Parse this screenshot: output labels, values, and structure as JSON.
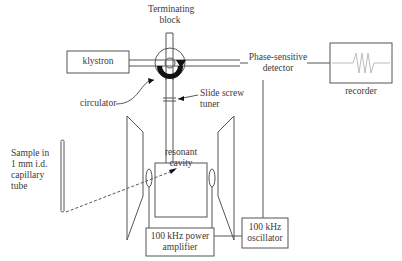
{
  "diagram": {
    "components": {
      "terminating_block": {
        "line1": "Terminating",
        "line2": "block"
      },
      "klystron": "klystron",
      "phase_detector": {
        "line1": "Phase-sensitive",
        "line2": "detector"
      },
      "recorder": "recorder",
      "circulator": "circulator",
      "slide_screw": {
        "line1": "Slide screw",
        "line2": "tuner"
      },
      "sample": {
        "line1": "Sample in",
        "line2": "1 mm i.d.",
        "line3": "capillary",
        "line4": "tube"
      },
      "cavity": {
        "line1": "resonant",
        "line2": "cavity"
      },
      "amplifier": {
        "line1": "100 kHz power",
        "line2": "amplifier"
      },
      "oscillator": {
        "line1": "100 kHz",
        "line2": "oscillator"
      }
    },
    "colors": {
      "line": "#555555",
      "text": "#3a3a3a",
      "arrow_fill": "#111111",
      "trace": "#bbbbbb"
    }
  }
}
